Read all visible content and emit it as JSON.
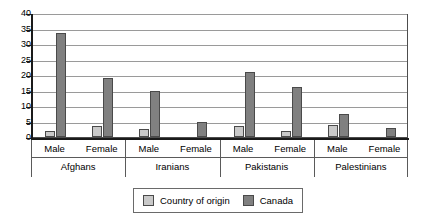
{
  "chart_data": {
    "type": "bar",
    "title": "",
    "subtitle": "",
    "xlabel": "",
    "ylabel": "",
    "ylim": [
      0,
      40
    ],
    "yticks": [
      0,
      5,
      10,
      15,
      20,
      25,
      30,
      35,
      40
    ],
    "ytick_labels": [
      "0",
      "5",
      "10",
      "15",
      "20",
      "25",
      "30",
      "35",
      "40"
    ],
    "grid": true,
    "legend_position": "bottom-center",
    "groups": [
      "Afghans",
      "Iranians",
      "Pakistanis",
      "Palestinians"
    ],
    "subcategories": [
      "Male",
      "Female"
    ],
    "categories": [
      "Afghans Male",
      "Afghans Female",
      "Iranians Male",
      "Iranians Female",
      "Pakistanis Male",
      "Pakistanis Female",
      "Palestinians Male",
      "Palestinians Female"
    ],
    "series": [
      {
        "name": "Country of origin",
        "color": "#c9c9c9",
        "values": [
          2,
          3.5,
          2.5,
          0,
          3.5,
          1.8,
          3.8,
          0
        ]
      },
      {
        "name": "Canada",
        "color": "#808080",
        "values": [
          33.5,
          19,
          15,
          5,
          21,
          16,
          7.5,
          2.8
        ]
      }
    ]
  },
  "legend": {
    "items": [
      {
        "label": "Country of origin",
        "swatch": "origin"
      },
      {
        "label": "Canada",
        "swatch": "canada"
      }
    ]
  },
  "colors": {
    "origin": "#c9c9c9",
    "canada": "#808080",
    "axis": "#1a1a1a",
    "grid": "#9a9a9a",
    "background": "#ffffff"
  }
}
